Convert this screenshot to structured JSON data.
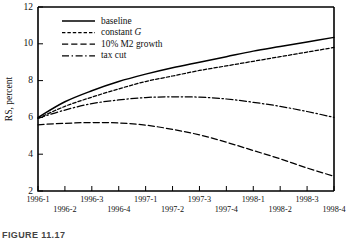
{
  "figure": {
    "caption": "FIGURE 11.17",
    "ylabel": "RS, percent"
  },
  "chart_data": {
    "type": "line",
    "title": "",
    "xlabel": "",
    "ylabel": "RS, percent",
    "ylim": [
      2,
      12
    ],
    "yticks": [
      2,
      4,
      6,
      8,
      10,
      12
    ],
    "grid": false,
    "legend_position": "top-left",
    "categories": [
      "1996-1",
      "1996-2",
      "1996-3",
      "1996-4",
      "1997-1",
      "1997-2",
      "1997-3",
      "1997-4",
      "1998-1",
      "1998-2",
      "1998-3",
      "1998-4"
    ],
    "series": [
      {
        "name": "baseline",
        "style": "solid",
        "values": [
          6.0,
          6.85,
          7.45,
          7.95,
          8.35,
          8.7,
          9.0,
          9.3,
          9.6,
          9.85,
          10.1,
          10.35
        ]
      },
      {
        "name": "constant G",
        "style": "dotted",
        "values": [
          5.95,
          6.6,
          7.1,
          7.55,
          7.95,
          8.25,
          8.55,
          8.8,
          9.05,
          9.3,
          9.55,
          9.8
        ]
      },
      {
        "name": "10% M2 growth",
        "style": "dashed",
        "values": [
          5.6,
          5.68,
          5.72,
          5.7,
          5.58,
          5.35,
          5.05,
          4.65,
          4.2,
          3.75,
          3.25,
          2.8
        ]
      },
      {
        "name": "tax cut",
        "style": "dash-dot",
        "values": [
          5.95,
          6.4,
          6.75,
          6.95,
          7.08,
          7.12,
          7.1,
          7.0,
          6.82,
          6.6,
          6.32,
          6.0
        ]
      }
    ]
  },
  "legend": {
    "entries": [
      {
        "label": "baseline",
        "style": "solid"
      },
      {
        "label": "constant G",
        "style": "dotted"
      },
      {
        "label": "10% M2 growth",
        "style": "dashed"
      },
      {
        "label": "tax cut",
        "style": "dash-dot"
      }
    ]
  },
  "colors": {
    "ink": "#000000",
    "background": "#ffffff"
  }
}
